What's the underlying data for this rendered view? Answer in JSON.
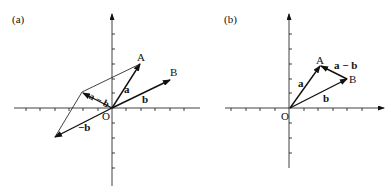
{
  "panels": [
    {
      "id": "a",
      "label": "(a)",
      "origin_label": "O",
      "points": {
        "A": "A",
        "B": "B"
      },
      "vectors": {
        "a": "a",
        "b": "b",
        "neg_b": "−b",
        "a_minus_b": "a − b"
      }
    },
    {
      "id": "b",
      "label": "(b)",
      "origin_label": "O",
      "points": {
        "A": "A",
        "B": "B"
      },
      "vectors": {
        "a": "a",
        "b": "b",
        "a_minus_b": "a − b"
      }
    }
  ]
}
